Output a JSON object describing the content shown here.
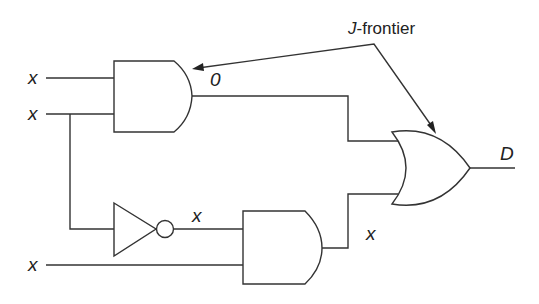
{
  "diagram": {
    "type": "logic-circuit",
    "annotation": {
      "italic": "J",
      "rest": "-frontier"
    },
    "inputs": [
      {
        "id": "in1",
        "label": "x"
      },
      {
        "id": "in2",
        "label": "x"
      },
      {
        "id": "in3",
        "label": "x"
      }
    ],
    "gates": [
      {
        "id": "and1",
        "type": "AND",
        "output_label": "0"
      },
      {
        "id": "not1",
        "type": "NOT",
        "output_label": "x"
      },
      {
        "id": "and2",
        "type": "AND",
        "output_label": "x"
      },
      {
        "id": "or1",
        "type": "OR",
        "output_label": "D"
      }
    ],
    "j_frontier_targets": [
      "and1",
      "or1"
    ],
    "colors": {
      "line": "#333333",
      "background": "#ffffff"
    }
  }
}
